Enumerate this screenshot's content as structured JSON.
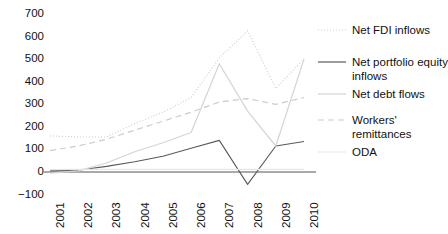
{
  "chart_data": {
    "type": "line",
    "title": "",
    "subtitle": "",
    "xlabel": "",
    "ylabel": "",
    "x": [
      2001,
      2002,
      2003,
      2004,
      2005,
      2006,
      2007,
      2008,
      2009,
      2010
    ],
    "categories": [
      "2001",
      "2002",
      "2003",
      "2004",
      "2005",
      "2006",
      "2007",
      "2008",
      "2009",
      "2010"
    ],
    "xlim": [
      2001,
      2010
    ],
    "ylim": [
      -100,
      800
    ],
    "yticks": [
      -100,
      0,
      100,
      200,
      300,
      400,
      500,
      600,
      700,
      800
    ],
    "ytick_labels": [
      "−100",
      "0",
      "100",
      "200",
      "300",
      "400",
      "500",
      "600",
      "700",
      "800"
    ],
    "grid": false,
    "legend_position": "right",
    "zero_line": true,
    "series": [
      {
        "name": "Net FDI inflows",
        "style": "dotted",
        "color": "#cfcfcf",
        "values": [
          160,
          155,
          155,
          215,
          265,
          330,
          505,
          625,
          370,
          500
        ]
      },
      {
        "name": "Net portfolio equity inflows",
        "style": "solid",
        "color": "#5a5a5a",
        "values": [
          5,
          8,
          25,
          45,
          70,
          105,
          140,
          -55,
          115,
          135
        ]
      },
      {
        "name": "Net debt flows",
        "style": "solid",
        "color": "#d4d4d4",
        "values": [
          -5,
          5,
          40,
          90,
          130,
          175,
          480,
          270,
          115,
          500
        ]
      },
      {
        "name": "Workers' remittances",
        "style": "dashed",
        "color": "#cbcbcb",
        "values": [
          95,
          115,
          145,
          185,
          225,
          265,
          310,
          325,
          300,
          330
        ]
      },
      {
        "name": "ODA",
        "style": "solid",
        "color": "#e6e6e6",
        "values": [
          10,
          12,
          12,
          12,
          12,
          12,
          12,
          12,
          12,
          12
        ]
      }
    ]
  },
  "y_axis": {
    "ticks": [
      {
        "label": "800",
        "value": 800
      },
      {
        "label": "700",
        "value": 700
      },
      {
        "label": "600",
        "value": 600
      },
      {
        "label": "500",
        "value": 500
      },
      {
        "label": "400",
        "value": 400
      },
      {
        "label": "300",
        "value": 300
      },
      {
        "label": "200",
        "value": 200
      },
      {
        "label": "100",
        "value": 100
      },
      {
        "label": "0",
        "value": 0
      },
      {
        "label": "−100",
        "value": -100
      }
    ]
  },
  "x_axis": {
    "ticks": [
      {
        "label": "2001"
      },
      {
        "label": "2002"
      },
      {
        "label": "2003"
      },
      {
        "label": "2004"
      },
      {
        "label": "2005"
      },
      {
        "label": "2006"
      },
      {
        "label": "2007"
      },
      {
        "label": "2008"
      },
      {
        "label": "2009"
      },
      {
        "label": "2010"
      }
    ]
  },
  "legend": {
    "items": [
      {
        "label": "Net FDI inflows",
        "style": "dotted",
        "color": "#cfcfcf"
      },
      {
        "label": "Net portfolio equity inflows",
        "style": "solid",
        "color": "#5a5a5a"
      },
      {
        "label": "Net debt flows",
        "style": "solid",
        "color": "#d4d4d4"
      },
      {
        "label": "Workers' remittances",
        "style": "dashed",
        "color": "#cbcbcb"
      },
      {
        "label": "ODA",
        "style": "solid",
        "color": "#ececec"
      }
    ]
  }
}
